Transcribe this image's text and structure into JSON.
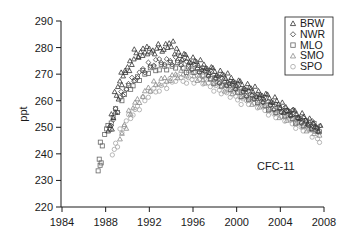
{
  "chart_data": {
    "type": "scatter",
    "title": "",
    "annotation": "CFC-11",
    "xlabel": "",
    "ylabel": "ppt",
    "xlim": [
      1984,
      2008
    ],
    "ylim": [
      220,
      290
    ],
    "x_ticks": [
      1984,
      1988,
      1992,
      1996,
      2000,
      2004,
      2008
    ],
    "y_ticks": [
      220,
      230,
      240,
      250,
      260,
      270,
      280,
      290
    ],
    "grid": false,
    "legend_position": "upper right",
    "series": [
      {
        "name": "BRW",
        "marker": "triangle",
        "color": "#333333",
        "x": [
          1988.4,
          1988.7,
          1989.0,
          1989.3,
          1989.6,
          1990.0,
          1990.4,
          1990.8,
          1991.2,
          1991.6,
          1992.0,
          1992.5,
          1993.0,
          1993.5,
          1994.0,
          1994.5,
          1995.0,
          1995.5,
          1996.0,
          1996.5,
          1997.0,
          1997.5,
          1998.0,
          1998.5,
          1999.0,
          1999.5,
          2000.0,
          2000.5,
          2001.0,
          2001.5,
          2002.0,
          2002.5,
          2003.0,
          2003.5,
          2004.0,
          2004.5,
          2005.0,
          2005.5,
          2006.0,
          2006.5,
          2007.0,
          2007.5
        ],
        "y": [
          250,
          255,
          262,
          266,
          270,
          272,
          275,
          278,
          277,
          279,
          279,
          279,
          280,
          280,
          281,
          279,
          277,
          276,
          275,
          274,
          273,
          272,
          271,
          270,
          269,
          268,
          267,
          266,
          265,
          264,
          263,
          262,
          261,
          260,
          258,
          257,
          256,
          255,
          254,
          252,
          251,
          250
        ]
      },
      {
        "name": "NWR",
        "marker": "diamond",
        "color": "#444444",
        "x": [
          1988.6,
          1989.0,
          1989.5,
          1990.0,
          1990.5,
          1991.0,
          1991.5,
          1992.0,
          1992.5,
          1993.0,
          1993.5,
          1994.0,
          1994.5,
          1995.0,
          1995.5,
          1996.0,
          1996.5,
          1997.0,
          1997.5,
          1998.0,
          1998.5,
          1999.0,
          1999.5,
          2000.0,
          2000.5,
          2001.0,
          2001.5,
          2002.0,
          2002.5,
          2003.0,
          2003.5,
          2004.0,
          2004.5,
          2005.0,
          2005.5,
          2006.0,
          2006.5,
          2007.0,
          2007.5
        ],
        "y": [
          252,
          257,
          262,
          265,
          268,
          270,
          272,
          273,
          274,
          275,
          275,
          275,
          275,
          274,
          274,
          273,
          272,
          271,
          270,
          269,
          268,
          267,
          266,
          265,
          264,
          263,
          262,
          261,
          260,
          259,
          258,
          257,
          256,
          255,
          254,
          253,
          252,
          251,
          249
        ]
      },
      {
        "name": "MLO",
        "marker": "square",
        "color": "#666666",
        "x": [
          1987.4,
          1987.5,
          1987.6,
          1988.0,
          1988.3,
          1988.6,
          1989.0,
          1989.4,
          1989.8,
          1990.2,
          1990.6,
          1991.0,
          1991.5,
          1992.0,
          1992.5,
          1993.0,
          1993.5,
          1994.0,
          1994.5,
          1995.0,
          1995.5,
          1996.0,
          1996.5,
          1997.0,
          1997.5,
          1998.0,
          1998.5,
          1999.0,
          1999.5,
          2000.0,
          2000.5,
          2001.0,
          2001.5,
          2002.0,
          2002.5,
          2003.0,
          2003.5,
          2004.0,
          2004.5,
          2005.0,
          2005.5,
          2006.0,
          2006.5,
          2007.0,
          2007.5
        ],
        "y": [
          235,
          238,
          243,
          248,
          250,
          253,
          257,
          260,
          263,
          265,
          267,
          269,
          270,
          271,
          272,
          273,
          273,
          273,
          273,
          273,
          272,
          272,
          271,
          270,
          269,
          268,
          267,
          266,
          265,
          264,
          263,
          262,
          261,
          260,
          259,
          258,
          257,
          256,
          255,
          254,
          253,
          252,
          251,
          250,
          249
        ]
      },
      {
        "name": "SMO",
        "marker": "triangle",
        "color": "#8c8c8c",
        "x": [
          1989.4,
          1989.8,
          1990.2,
          1990.6,
          1991.0,
          1991.5,
          1992.0,
          1992.5,
          1993.0,
          1993.5,
          1994.0,
          1994.5,
          1995.0,
          1995.5,
          1996.0,
          1996.5,
          1997.0,
          1997.5,
          1998.0,
          1998.5,
          1999.0,
          1999.5,
          2000.0,
          2000.5,
          2001.0,
          2001.5,
          2002.0,
          2002.5,
          2003.0,
          2003.5,
          2004.0,
          2004.5,
          2005.0,
          2005.5,
          2006.0,
          2006.5,
          2007.0,
          2007.5
        ],
        "y": [
          247,
          251,
          255,
          258,
          260,
          263,
          265,
          266,
          267,
          268,
          269,
          270,
          270,
          270,
          270,
          269,
          268,
          268,
          267,
          266,
          265,
          264,
          263,
          262,
          261,
          260,
          259,
          258,
          257,
          256,
          255,
          254,
          253,
          252,
          251,
          250,
          249,
          247
        ]
      },
      {
        "name": "SPO",
        "marker": "circle",
        "color": "#a6a6a6",
        "x": [
          1988.7,
          1989.0,
          1989.4,
          1989.8,
          1990.2,
          1990.6,
          1991.0,
          1991.5,
          1992.0,
          1992.5,
          1993.0,
          1993.5,
          1994.0,
          1994.5,
          1995.0,
          1995.5,
          1996.0,
          1996.5,
          1997.0,
          1997.5,
          1998.0,
          1998.5,
          1999.0,
          1999.5,
          2000.0,
          2000.5,
          2001.0,
          2001.5,
          2002.0,
          2002.5,
          2003.0,
          2003.5,
          2004.0,
          2004.5,
          2005.0,
          2005.5,
          2006.0,
          2006.5,
          2007.0,
          2007.5
        ],
        "y": [
          241,
          244,
          248,
          251,
          254,
          256,
          258,
          260,
          262,
          264,
          265,
          266,
          267,
          268,
          268,
          268,
          268,
          268,
          267,
          266,
          265,
          264,
          263,
          262,
          261,
          260,
          260,
          259,
          258,
          257,
          256,
          255,
          254,
          253,
          252,
          251,
          250,
          249,
          247,
          245
        ]
      }
    ]
  },
  "legend": {
    "items": [
      {
        "label": "BRW",
        "marker": "triangle",
        "color": "#333333"
      },
      {
        "label": "NWR",
        "marker": "diamond",
        "color": "#444444"
      },
      {
        "label": "MLO",
        "marker": "square",
        "color": "#666666"
      },
      {
        "label": "SMO",
        "marker": "triangle",
        "color": "#8c8c8c"
      },
      {
        "label": "SPO",
        "marker": "circle",
        "color": "#a6a6a6"
      }
    ]
  },
  "axis_color": "#1a1a1a"
}
